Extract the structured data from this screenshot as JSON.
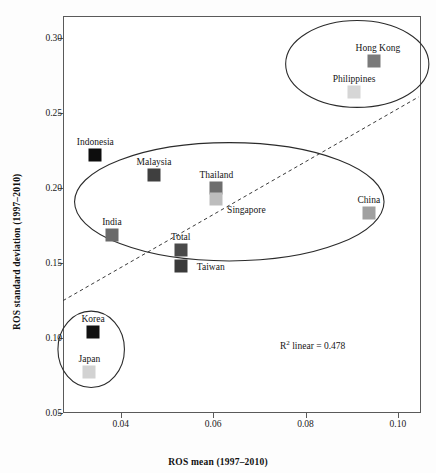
{
  "chart_data": {
    "type": "scatter",
    "title": "",
    "xlabel": "ROS mean (1997–2010)",
    "ylabel": "ROS standard deviation (1997–2010)",
    "xlim": [
      0.0275,
      0.105
    ],
    "ylim": [
      0.05,
      0.315
    ],
    "xticks": [
      0.04,
      0.06,
      0.08,
      0.1
    ],
    "xticklabels": [
      "0.04",
      "0.06",
      "0.08",
      "0.10"
    ],
    "yticks": [
      0.05,
      0.1,
      0.15,
      0.2,
      0.25,
      0.3
    ],
    "yticklabels": [
      "0.05",
      "0.10",
      "0.15",
      "0.20",
      "0.25",
      "0.30"
    ],
    "grid": false,
    "legend": null,
    "annotations": [
      {
        "text_prefix": "R",
        "text_sup": "2",
        "text_suffix": " linear = 0.478",
        "x": 0.0835,
        "y": 0.107
      }
    ],
    "fit_line": {
      "style": "dashed",
      "r2": 0.478,
      "x_start": 0.0275,
      "y_start": 0.125,
      "x_end": 0.1045,
      "y_end": 0.261
    },
    "clusters": [
      {
        "name": "high-risk-cluster",
        "cx": 0.0912,
        "cy": 0.283,
        "rx": 0.0155,
        "ry": 0.029
      },
      {
        "name": "mid-cluster",
        "cx": 0.0635,
        "cy": 0.191,
        "rx": 0.0335,
        "ry": 0.0395
      },
      {
        "name": "low-risk-cluster",
        "cx": 0.0336,
        "cy": 0.0925,
        "rx": 0.0072,
        "ry": 0.0255
      }
    ],
    "points": [
      {
        "label": "Indonesia",
        "x": 0.0345,
        "y": 0.2225,
        "color": "#0d0d0d",
        "label_dx": 0,
        "label_dy": -13
      },
      {
        "label": "Malaysia",
        "x": 0.0472,
        "y": 0.209,
        "color": "#3f3f3f",
        "label_dx": 0,
        "label_dy": -13
      },
      {
        "label": "Thailand",
        "x": 0.0607,
        "y": 0.2005,
        "color": "#6e6e6e",
        "label_dx": 0,
        "label_dy": -13
      },
      {
        "label": "Singapore",
        "x": 0.0607,
        "y": 0.193,
        "color": "#bdbdbd",
        "label_dx": 30,
        "label_dy": 11
      },
      {
        "label": "India",
        "x": 0.0381,
        "y": 0.169,
        "color": "#6a6a6a",
        "label_dx": 0,
        "label_dy": -13
      },
      {
        "label": "Total",
        "x": 0.053,
        "y": 0.159,
        "color": "#4a4a4a",
        "label_dx": 0,
        "label_dy": -13
      },
      {
        "label": "Taiwan",
        "x": 0.053,
        "y": 0.148,
        "color": "#3a3a3a",
        "label_dx": 30,
        "label_dy": 1
      },
      {
        "label": "China",
        "x": 0.0937,
        "y": 0.1835,
        "color": "#a0a0a0",
        "label_dx": 0,
        "label_dy": -13
      },
      {
        "label": "Hong Kong",
        "x": 0.0948,
        "y": 0.285,
        "color": "#7a7a7a",
        "label_dx": 4,
        "label_dy": -13
      },
      {
        "label": "Philippines",
        "x": 0.0905,
        "y": 0.264,
        "color": "#d6d6d6",
        "label_dx": 0,
        "label_dy": -13
      },
      {
        "label": "Korea",
        "x": 0.034,
        "y": 0.104,
        "color": "#111111",
        "label_dx": 0,
        "label_dy": -13
      },
      {
        "label": "Japan",
        "x": 0.0332,
        "y": 0.0775,
        "color": "#d2d2d2",
        "label_dx": 0,
        "label_dy": -13
      }
    ]
  }
}
